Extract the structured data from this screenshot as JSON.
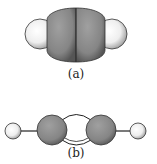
{
  "figures": [
    {
      "id": "a",
      "label": "(a)",
      "description": "space-filling model: two carbon atoms flanked by two hydrogen atoms"
    },
    {
      "id": "b",
      "label": "(b)",
      "description": "ball-and-stick model: H–C≡C–H with triple bond"
    }
  ],
  "colors": {
    "carbon": "#8a8a8a",
    "hydrogen": "#f4f4f4",
    "stroke": "#222222"
  }
}
